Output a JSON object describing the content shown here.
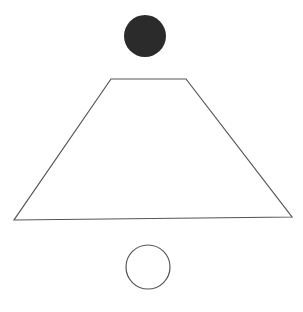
{
  "diagram": {
    "background": "#ffffff",
    "stroke_color": "#555555",
    "fill_color": "#2b2b2b",
    "shapes": {
      "filled_circle": {
        "cx": 145,
        "cy": 36,
        "r": 21
      },
      "trapezoid": {
        "points": "111,79 186,79 292,217 14,220"
      },
      "open_circle": {
        "cx": 148,
        "cy": 267,
        "r": 22
      }
    }
  }
}
